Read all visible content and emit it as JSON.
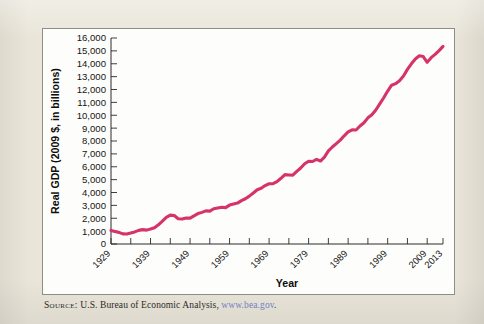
{
  "figure": {
    "background_color": "#e9e5d9",
    "plot_background_color": "#fdfdfb",
    "border_color": "#8f8e84"
  },
  "source": {
    "label": "Source:",
    "text": " U.S. Bureau of Economic Analysis, ",
    "url_text": "www.bea.gov",
    "url_color": "#6f7fc4",
    "trailing": "."
  },
  "chart_data": {
    "type": "line",
    "title": "",
    "xlabel": "Year",
    "ylabel": "Real GDP (2009 $, in billions)",
    "xlim": [
      1929,
      2013
    ],
    "ylim": [
      0,
      16000
    ],
    "grid": false,
    "legend": "none",
    "line_color": "#d6336c",
    "ytick_labels": [
      "16,000",
      "15,000",
      "14,000",
      "13,000",
      "12,000",
      "11,000",
      "10,000",
      "9,000",
      "8,000",
      "7,000",
      "6,000",
      "5,000",
      "4,000",
      "3,000",
      "2,000",
      "1,000",
      "0"
    ],
    "ytick_values": [
      16000,
      15000,
      14000,
      13000,
      12000,
      11000,
      10000,
      9000,
      8000,
      7000,
      6000,
      5000,
      4000,
      3000,
      2000,
      1000,
      0
    ],
    "xtick_labels": [
      "1929",
      "1939",
      "1949",
      "1959",
      "1969",
      "1979",
      "1989",
      "1999",
      "2009",
      "2013"
    ],
    "xtick_values": [
      1929,
      1939,
      1949,
      1959,
      1969,
      1979,
      1989,
      1999,
      2009,
      2013
    ],
    "xminor_values": [
      1934,
      1944,
      1954,
      1964,
      1974,
      1984,
      1994,
      2004
    ],
    "series": [
      {
        "name": "Real GDP",
        "x": [
          1929,
          1930,
          1931,
          1932,
          1933,
          1934,
          1935,
          1936,
          1937,
          1938,
          1939,
          1940,
          1941,
          1942,
          1943,
          1944,
          1945,
          1946,
          1947,
          1948,
          1949,
          1950,
          1951,
          1952,
          1953,
          1954,
          1955,
          1956,
          1957,
          1958,
          1959,
          1960,
          1961,
          1962,
          1963,
          1964,
          1965,
          1966,
          1967,
          1968,
          1969,
          1970,
          1971,
          1972,
          1973,
          1974,
          1975,
          1976,
          1977,
          1978,
          1979,
          1980,
          1981,
          1982,
          1983,
          1984,
          1985,
          1986,
          1987,
          1988,
          1989,
          1990,
          1991,
          1992,
          1993,
          1994,
          1995,
          1996,
          1997,
          1998,
          1999,
          2000,
          2001,
          2002,
          2003,
          2004,
          2005,
          2006,
          2007,
          2008,
          2009,
          2010,
          2011,
          2012,
          2013
        ],
        "values": [
          1057,
          966,
          904,
          788,
          778,
          862,
          939,
          1060,
          1115,
          1077,
          1163,
          1266,
          1490,
          1772,
          2074,
          2240,
          2218,
          1961,
          1940,
          2020,
          2009,
          2184,
          2361,
          2456,
          2571,
          2556,
          2736,
          2794,
          2851,
          2826,
          3021,
          3098,
          3176,
          3368,
          3515,
          3718,
          3960,
          4216,
          4329,
          4538,
          4681,
          4692,
          4845,
          5102,
          5389,
          5361,
          5351,
          5639,
          5899,
          6228,
          6425,
          6408,
          6572,
          6445,
          6743,
          7232,
          7533,
          7801,
          8065,
          8402,
          8703,
          8867,
          8854,
          9164,
          9418,
          9798,
          10032,
          10409,
          10877,
          11361,
          11882,
          12332,
          12455,
          12684,
          13045,
          13560,
          13994,
          14376,
          14618,
          14561,
          14115,
          14474,
          14728,
          15022,
          15348
        ]
      }
    ]
  }
}
